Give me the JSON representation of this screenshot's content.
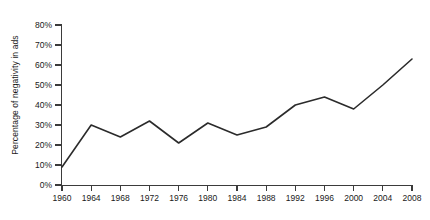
{
  "chart_data": {
    "type": "line",
    "title": "",
    "xlabel": "",
    "ylabel": "Percentage of negativity in ads",
    "x": [
      1960,
      1964,
      1968,
      1972,
      1976,
      1980,
      1984,
      1988,
      1992,
      1996,
      2000,
      2004,
      2008
    ],
    "values": [
      9,
      30,
      24,
      32,
      21,
      31,
      25,
      29,
      40,
      44,
      38,
      50,
      63
    ],
    "series": [
      {
        "name": "Percentage of negativity in ads",
        "values": [
          9,
          30,
          24,
          32,
          21,
          31,
          25,
          29,
          40,
          44,
          38,
          50,
          63
        ]
      }
    ],
    "xlim": [
      1960,
      2008
    ],
    "ylim": [
      0,
      80
    ],
    "y_ticks": [
      0,
      10,
      20,
      30,
      40,
      50,
      60,
      70,
      80
    ],
    "y_tick_labels": [
      "0%",
      "10%",
      "20%",
      "30%",
      "40%",
      "50%",
      "60%",
      "70%",
      "80%"
    ],
    "x_ticks": [
      1960,
      1964,
      1968,
      1972,
      1976,
      1980,
      1984,
      1988,
      1992,
      1996,
      2000,
      2004,
      2008
    ],
    "x_tick_labels": [
      "1960",
      "1964",
      "1968",
      "1972",
      "1976",
      "1980",
      "1984",
      "1988",
      "1992",
      "1996",
      "2000",
      "2004",
      "2008"
    ],
    "grid": false,
    "legend": false,
    "legend_position": "none",
    "line_color": "#2b2b2b",
    "background_color": "#ffffff",
    "axis_color": "#3b3b3b",
    "text_color": "#1a1a1a",
    "annotations": []
  }
}
